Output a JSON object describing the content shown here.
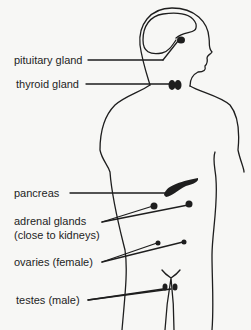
{
  "diagram": {
    "labels": [
      {
        "id": "pituitary",
        "text": "pituitary gland"
      },
      {
        "id": "thyroid",
        "text": "thyroid gland"
      },
      {
        "id": "pancreas",
        "text": "pancreas"
      },
      {
        "id": "adrenal",
        "text": "adrenal glands"
      },
      {
        "id": "adrenal_note",
        "text": "(close to kidneys)"
      },
      {
        "id": "ovaries",
        "text": "ovaries (female)"
      },
      {
        "id": "testes",
        "text": "testes (male)"
      }
    ],
    "colors": {
      "ink": "#1e1e1e",
      "background": "#f7f7f5"
    }
  }
}
